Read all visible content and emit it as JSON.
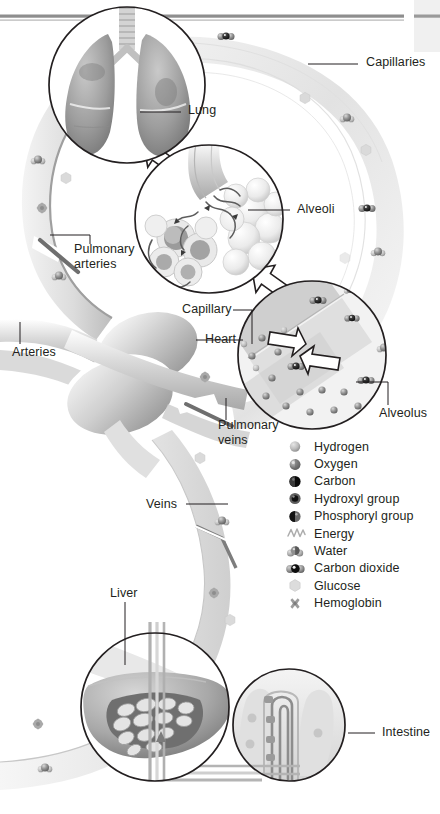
{
  "figure": {
    "background_color": "#ffffff",
    "ink_color": "#231f20",
    "vessel_light": "#ececec",
    "vessel_mid": "#d2d2d2",
    "vessel_dark": "#9a9a9a",
    "rule_color": "#8c8c8c"
  },
  "callouts": [
    {
      "id": "capillaries",
      "label": "Capillaries",
      "x": 366,
      "y": 60,
      "lines": 1
    },
    {
      "id": "lung",
      "label": "Lung",
      "x": 188,
      "y": 108,
      "lines": 1
    },
    {
      "id": "alveoli",
      "label": "Alveoli",
      "x": 297,
      "y": 206,
      "lines": 1
    },
    {
      "id": "pulmonary-arteries",
      "label": "Pulmonary\narteries",
      "x": 74,
      "y": 249,
      "lines": 2
    },
    {
      "id": "capillary",
      "label": "Capillary",
      "x": 182,
      "y": 306,
      "lines": 1
    },
    {
      "id": "heart",
      "label": "Heart",
      "x": 205,
      "y": 336,
      "lines": 1
    },
    {
      "id": "arteries",
      "label": "Arteries",
      "x": 12,
      "y": 349,
      "lines": 1
    },
    {
      "id": "pulmonary-veins",
      "label": "Pulmonary\nveins",
      "x": 218,
      "y": 424,
      "lines": 2
    },
    {
      "id": "alveolus",
      "label": "Alveolus",
      "x": 379,
      "y": 410,
      "lines": 1
    },
    {
      "id": "veins",
      "label": "Veins",
      "x": 146,
      "y": 500,
      "lines": 1
    },
    {
      "id": "liver",
      "label": "Liver",
      "x": 110,
      "y": 590,
      "lines": 1
    },
    {
      "id": "intestine",
      "label": "Intestine",
      "x": 382,
      "y": 729,
      "lines": 1
    }
  ],
  "legend": {
    "items": [
      {
        "id": "hydrogen",
        "label": "Hydrogen",
        "icon": "sphere-light-icon"
      },
      {
        "id": "oxygen",
        "label": "Oxygen",
        "icon": "sphere-medium-icon"
      },
      {
        "id": "carbon",
        "label": "Carbon",
        "icon": "sphere-black-icon"
      },
      {
        "id": "hydroxyl-group",
        "label": "Hydroxyl group",
        "icon": "sphere-dark-ring-icon"
      },
      {
        "id": "phosphoryl-group",
        "label": "Phosphoryl group",
        "icon": "sphere-half-dark-icon"
      },
      {
        "id": "energy",
        "label": "Energy",
        "icon": "energy-squiggle-icon"
      },
      {
        "id": "water",
        "label": "Water",
        "icon": "water-molecule-icon"
      },
      {
        "id": "carbon-dioxide",
        "label": "Carbon dioxide",
        "icon": "carbon-dioxide-molecule-icon"
      },
      {
        "id": "glucose",
        "label": "Glucose",
        "icon": "glucose-hexagon-icon"
      },
      {
        "id": "hemoglobin",
        "label": "Hemoglobin",
        "icon": "hemoglobin-cross-icon"
      }
    ]
  },
  "insets": [
    {
      "id": "lung-inset",
      "organ": "Lung",
      "cx": 127,
      "cy": 85,
      "r": 78
    },
    {
      "id": "alveoli-inset",
      "organ": "Alveoli",
      "cx": 209,
      "cy": 219,
      "r": 74
    },
    {
      "id": "alveolus-inset",
      "organ": "Alveolus",
      "cx": 312,
      "cy": 355,
      "r": 74
    },
    {
      "id": "liver-inset",
      "organ": "Liver",
      "cx": 155,
      "cy": 707,
      "r": 74
    },
    {
      "id": "intestine-inset",
      "organ": "Intestine",
      "cx": 289,
      "cy": 725,
      "r": 56
    }
  ]
}
